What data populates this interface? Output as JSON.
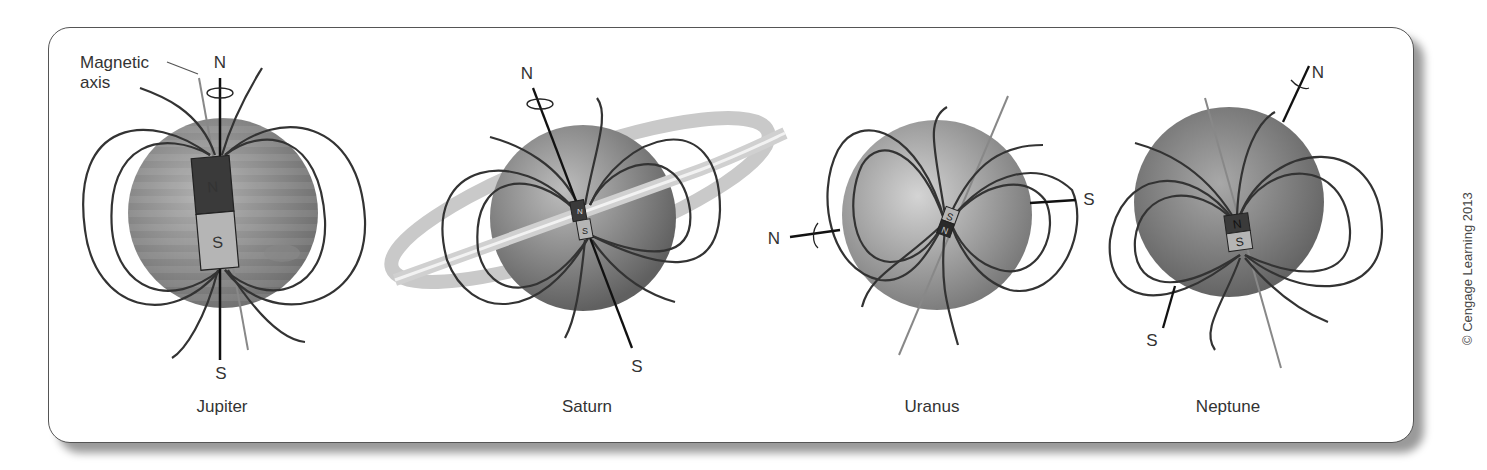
{
  "figure": {
    "annotation_magnetic_axis": [
      "Magnetic",
      "axis"
    ],
    "copyright": "© Cengage Learning 2013"
  },
  "planets": [
    {
      "name": "Jupiter",
      "rotation_north": "N",
      "rotation_south": "S",
      "magnet_north": "N",
      "magnet_south": "S",
      "magnet_size": "large",
      "magnet_tilt_deg": -10
    },
    {
      "name": "Saturn",
      "rotation_north": "N",
      "rotation_south": "S",
      "magnet_north": "N",
      "magnet_south": "S",
      "magnet_size": "small",
      "magnet_tilt_deg": 0
    },
    {
      "name": "Uranus",
      "rotation_north": "N",
      "rotation_south": "S",
      "magnet_north": "N",
      "magnet_south": "S",
      "magnet_size": "small",
      "magnet_tilt_deg": 200
    },
    {
      "name": "Neptune",
      "rotation_north": "N",
      "rotation_south": "S",
      "magnet_north": "N",
      "magnet_south": "S",
      "magnet_size": "small",
      "magnet_tilt_deg": -10
    }
  ],
  "colors": {
    "field_line": "#333333",
    "magnetic_axis": "#808080",
    "magnet_north": "#3a3a3a",
    "magnet_south": "#b5b5b5",
    "planet_light": "#c8c8c8",
    "planet_dark": "#6a6a6a"
  }
}
